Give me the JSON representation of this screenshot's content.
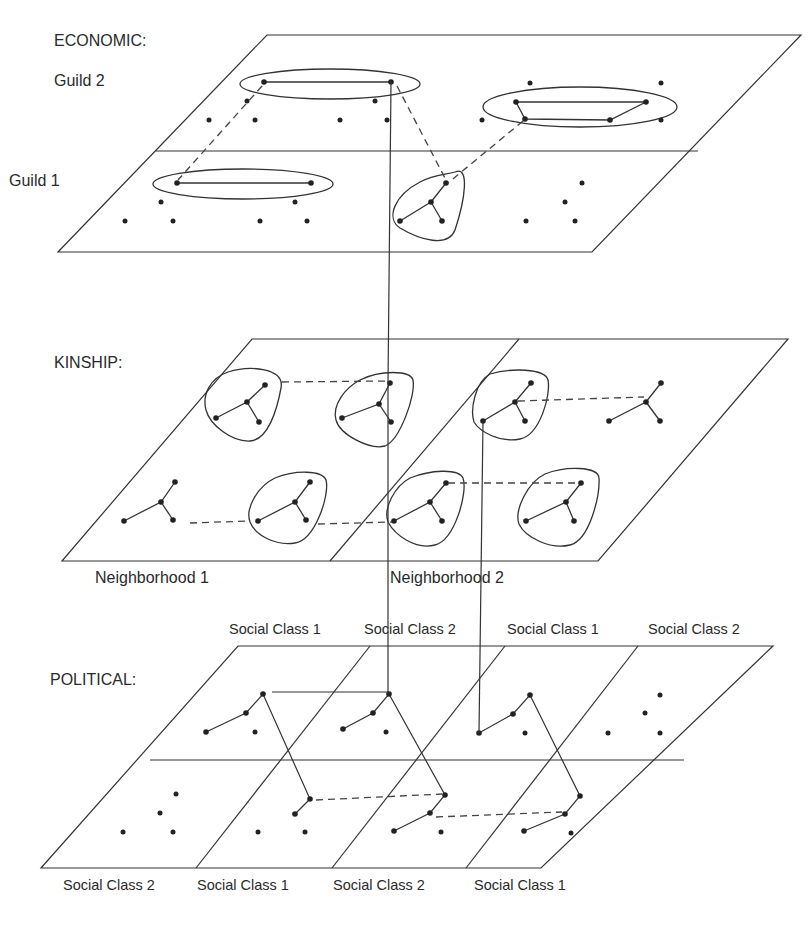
{
  "layers": {
    "economic": {
      "title": "ECONOMIC:",
      "sublabels": {
        "top": "Guild 2",
        "bottom": "Guild 1"
      }
    },
    "kinship": {
      "title": "KINSHIP:",
      "bottom_labels": [
        "Neighborhood 1",
        "Neighborhood 2"
      ]
    },
    "political": {
      "title": "POLITICAL:",
      "top_labels": [
        "Social Class 1",
        "Social Class 2",
        "Social Class 1",
        "Social Class 2"
      ],
      "bottom_labels": [
        "Social Class 2",
        "Social Class 1",
        "Social Class 2",
        "Social Class 1"
      ]
    }
  },
  "colors": {
    "stroke": "#333333",
    "node": "#222222",
    "background": "#ffffff"
  },
  "legend_semantics": {
    "solid_line": "tie within layer / cross-layer identity",
    "dashed_line": "cross-group tie",
    "outline": "group / cluster"
  }
}
